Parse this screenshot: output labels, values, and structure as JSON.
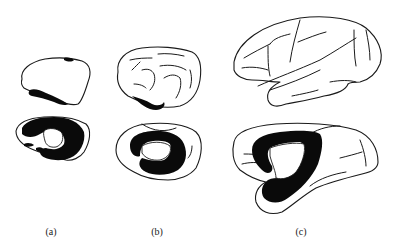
{
  "figure": {
    "panels": [
      {
        "id": "a",
        "label": "(a)",
        "views": [
          "lateral",
          "medial"
        ],
        "relative_size": "small"
      },
      {
        "id": "b",
        "label": "(b)",
        "views": [
          "lateral",
          "medial"
        ],
        "relative_size": "medium"
      },
      {
        "id": "c",
        "label": "(c)",
        "views": [
          "lateral",
          "medial"
        ],
        "relative_size": "large"
      }
    ],
    "colors": {
      "background": "#ffffff",
      "outline": "#1a1a1a",
      "shaded_region": "#0a0a0a"
    }
  }
}
